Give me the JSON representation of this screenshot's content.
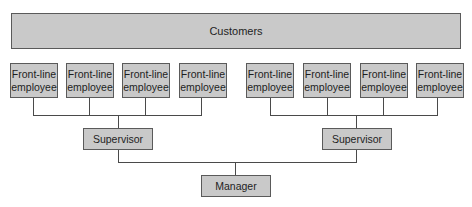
{
  "diagram": {
    "type": "org-chart",
    "top": {
      "label": "Customers"
    },
    "front_line": [
      {
        "line1": "Front-line",
        "line2": "employee"
      },
      {
        "line1": "Front-line",
        "line2": "employee"
      },
      {
        "line1": "Front-line",
        "line2": "employee"
      },
      {
        "line1": "Front-line",
        "line2": "employee"
      },
      {
        "line1": "Front-line",
        "line2": "employee"
      },
      {
        "line1": "Front-line",
        "line2": "employee"
      },
      {
        "line1": "Front-line",
        "line2": "employee"
      },
      {
        "line1": "Front-line",
        "line2": "employee"
      }
    ],
    "supervisors": [
      {
        "label": "Supervisor"
      },
      {
        "label": "Supervisor"
      }
    ],
    "manager": {
      "label": "Manager"
    },
    "colors": {
      "box_fill": "#c9c9c9",
      "box_border": "#5a5a5a",
      "line": "#4a4a4a"
    }
  }
}
